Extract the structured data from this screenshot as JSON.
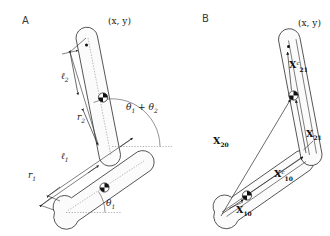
{
  "figure": {
    "type": "two-link-planar-manipulator-diagram",
    "background_color": "#ffffff",
    "ink_color": "#1a1a1a",
    "width": 330,
    "height": 236
  },
  "panels": [
    {
      "id": "A",
      "letter": "A",
      "description": "Two-link arm with length and angle parameters",
      "labels": {
        "endpoint": "(x, y)",
        "link2_length": "ℓ",
        "link2_length_sub": "2",
        "link2_com": "r",
        "link2_com_sub": "2",
        "link1_length": "ℓ",
        "link1_length_sub": "1",
        "link1_com": "r",
        "link1_com_sub": "1",
        "angle_base": "θ",
        "angle_base_sub": "1",
        "angle_tip": "θ",
        "angle_tip_sub1": "1",
        "angle_tip_plus": " + ",
        "angle_tip_2": "θ",
        "angle_tip_sub2": "2"
      }
    },
    {
      "id": "B",
      "letter": "B",
      "description": "Two-link arm with position vectors to centers of mass and joints",
      "labels": {
        "endpoint": "(x, y)",
        "vec_21c": "X",
        "vec_21c_sub": "21",
        "vec_21c_sup": "c",
        "vec_21": "X",
        "vec_21_sub": "21",
        "vec_20": "X",
        "vec_20_sub": "20",
        "vec_10c": "X",
        "vec_10c_sub": "10",
        "vec_10c_sup": "c",
        "vec_10": "X",
        "vec_10_sub": "10"
      }
    }
  ]
}
